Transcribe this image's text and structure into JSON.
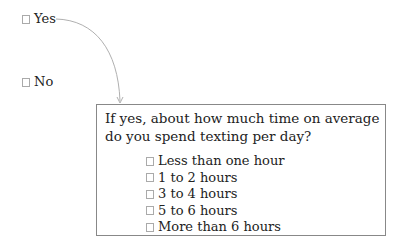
{
  "question1": {
    "options": [
      {
        "label": "Yes",
        "checked": false
      },
      {
        "label": "No",
        "checked": false
      }
    ]
  },
  "followup": {
    "prompt": "If yes, about how much time on average do you spend texting per day?",
    "options": [
      {
        "label": "Less than one hour",
        "checked": false
      },
      {
        "label": "1 to 2 hours",
        "checked": false
      },
      {
        "label": "3 to 4 hours",
        "checked": false
      },
      {
        "label": "5 to 6 hours",
        "checked": false
      },
      {
        "label": "More than 6 hours",
        "checked": false
      }
    ]
  },
  "colors": {
    "arrow": "#aaaaaa",
    "border": "#888888",
    "text": "#222222"
  }
}
